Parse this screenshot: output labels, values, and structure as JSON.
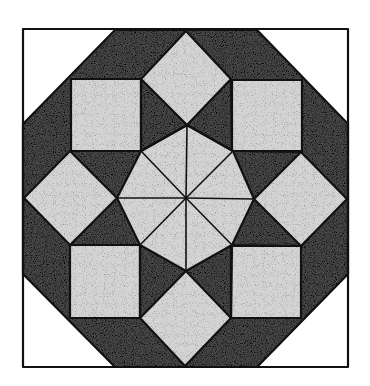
{
  "figure": {
    "colors": {
      "background": "#ffffff",
      "outline": "#111111",
      "dark_fill": "#4a4a4a",
      "light_fill": "#d4d4d4",
      "corner_fill": "#ffffff"
    },
    "outer_square": [
      23,
      29,
      348,
      367
    ],
    "outer_octagon": [
      [
        115,
        30
      ],
      [
        257,
        30
      ],
      [
        348,
        124
      ],
      [
        348,
        274
      ],
      [
        257,
        367
      ],
      [
        115,
        367
      ],
      [
        23,
        274
      ],
      [
        23,
        124
      ]
    ],
    "corner_squares": [
      {
        "name": "top-left",
        "x": 71,
        "y": 79,
        "w": 70,
        "h": 72
      },
      {
        "name": "top-right",
        "x": 232,
        "y": 80,
        "w": 70,
        "h": 71
      },
      {
        "name": "bottom-left",
        "x": 70,
        "y": 245,
        "w": 70,
        "h": 73
      },
      {
        "name": "bottom-right",
        "x": 231,
        "y": 246,
        "w": 70,
        "h": 72
      }
    ],
    "diamonds": [
      {
        "name": "top",
        "points": [
          [
            186,
            31
          ],
          [
            231,
            79
          ],
          [
            187,
            125
          ],
          [
            141,
            79
          ]
        ]
      },
      {
        "name": "right",
        "points": [
          [
            301,
            152
          ],
          [
            347,
            199
          ],
          [
            301,
            246
          ],
          [
            254,
            199
          ]
        ]
      },
      {
        "name": "bottom",
        "points": [
          [
            186,
            271
          ],
          [
            231,
            318
          ],
          [
            185,
            366
          ],
          [
            140,
            318
          ]
        ]
      },
      {
        "name": "left",
        "points": [
          [
            70,
            151
          ],
          [
            117,
            198
          ],
          [
            70,
            245
          ],
          [
            24,
            198
          ]
        ]
      }
    ],
    "center_octagon": {
      "center": [
        186,
        198
      ],
      "points": [
        [
          187,
          125
        ],
        [
          233,
          151
        ],
        [
          254,
          199
        ],
        [
          232,
          245
        ],
        [
          186,
          271
        ],
        [
          140,
          245
        ],
        [
          117,
          198
        ],
        [
          141,
          151
        ]
      ]
    }
  }
}
